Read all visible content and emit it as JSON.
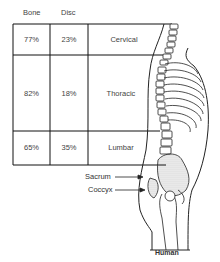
{
  "headers": {
    "bone": "Bone",
    "disc": "Disc"
  },
  "rows": [
    {
      "bone": "77%",
      "disc": "23%",
      "region": "Cervical"
    },
    {
      "bone": "82%",
      "disc": "18%",
      "region": "Thoracic"
    },
    {
      "bone": "65%",
      "disc": "35%",
      "region": "Lumbar"
    }
  ],
  "labels": {
    "sacrum": "Sacrum",
    "coccyx": "Coccyx"
  },
  "caption": "Human"
}
